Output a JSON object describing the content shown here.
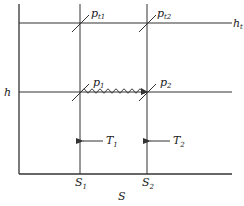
{
  "diagram": {
    "type": "h-s (Mollier) diagram, stagnation states",
    "axes": {
      "x_label": "S",
      "y_label": "h"
    },
    "lines": {
      "h_t_label": "h",
      "h_t_sub": "t",
      "h_label": "h"
    },
    "points": [
      {
        "name": "p",
        "sub": "t1"
      },
      {
        "name": "p",
        "sub": "t2"
      },
      {
        "name": "p",
        "sub": "1"
      },
      {
        "name": "p",
        "sub": "2"
      }
    ],
    "temperatures": [
      {
        "name": "T",
        "sub": "1"
      },
      {
        "name": "T",
        "sub": "2"
      }
    ],
    "entropies": [
      {
        "name": "S",
        "sub": "1"
      },
      {
        "name": "S",
        "sub": "2"
      }
    ],
    "colors": {
      "line": "#333333",
      "text": "#222222",
      "background": "#ffffff"
    }
  }
}
